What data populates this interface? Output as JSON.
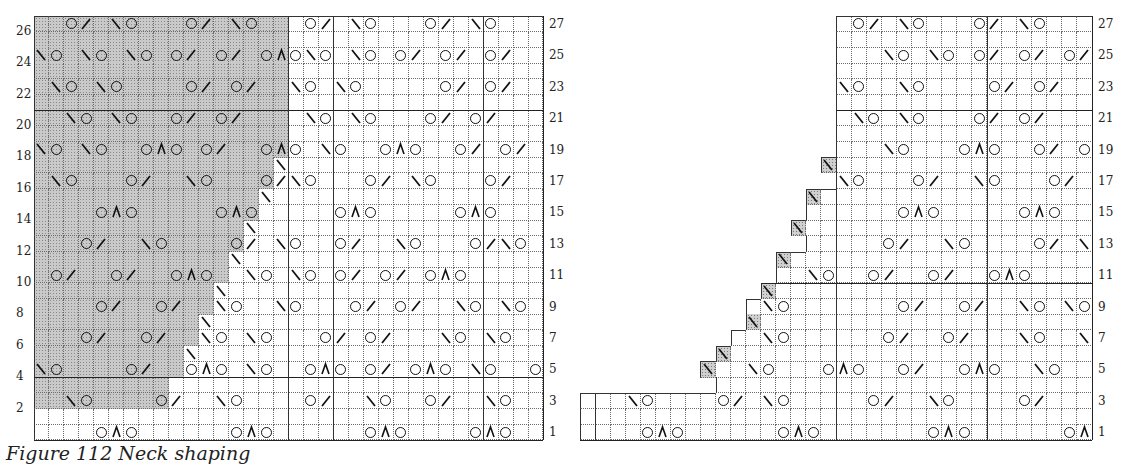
{
  "figure": {
    "caption": "Figure 112  Neck shaping",
    "symbols": {
      "O": "yarn-over",
      "/": "k2tog",
      "\\": "ssk",
      "A": "sk2p-double-decrease",
      ".": "knit",
      "-": "no-stitch",
      "s": "shaded-bound-off",
      "d": "shaded-decrease"
    },
    "colors": {
      "grid": "#6a6a6a",
      "ink": "#111111",
      "shade": "#c9c9c9"
    }
  },
  "left_chart": {
    "x": 34,
    "y": 16,
    "cols": 34,
    "rows": 27,
    "cell_w": 14.97,
    "cell_h": 15.7,
    "right_labels": [
      "27",
      "25",
      "23",
      "21",
      "19",
      "17",
      "15",
      "13",
      "11",
      "9",
      "7",
      "5",
      "3",
      "1"
    ],
    "left_labels": [
      "26",
      "24",
      "22",
      "20",
      "18",
      "16",
      "14",
      "12",
      "10",
      "8",
      "6",
      "4",
      "2"
    ],
    "heavy_rows_after": [
      6,
      23
    ],
    "repeat_cols": [
      17,
      20,
      30
    ],
    "grid": [
      "..O/.\\O...O/.\\O...O/.\\O...O/.\\O...",
      "..................................",
      "\\O.\\O.\\O.O/.O/.OAO\\O.\\O.O/.O/.O/.",
      "..................................",
      ".\\O.\\O....O/.O/..\\O.\\O.....O/.O/..",
      "..................................",
      "..\\O.\\O..O/.O/....\\O.\\O...O/.O/...",
      "..................................",
      "\\O.\\O..OAO.O/..OAO.\\O..OAO..O/.O/.",
      "................\\.................",
      ".\\O...O/..\\O...O/\\O...O/.\\O...O/..",
      "...............\\..................",
      "....OAO.....OAO.....OAO.....OAO....",
      "..............\\...................",
      "...O/..\\O....O/.\\O..O/..\\O...O/\\O.",
      ".............\\....................",
      ".O/..O/..OAO..\\O.\\O.O/.O/.OAO.....",
      "............\\.....................",
      "....O/..O/..\\O..\\O...O/.O/..\\O.\\O.",
      "...........\\......................",
      "...O/..O/..\\O.\\O...O/.O/...\\O.\\O..",
      "..........\\.......................",
      "\\O....O/..OAO.\\O..OAO.O/.OAO.\\O..O/",
      "..................................",
      "..\\O....O/..\\O....O/..\\O..O/..\\O..",
      "..................................",
      "....OAO......OAO......OAO....OAO..."
    ],
    "shade_to_col": [
      17,
      17,
      17,
      17,
      17,
      17,
      17,
      17,
      17,
      16,
      16,
      15,
      15,
      14,
      14,
      13,
      13,
      12,
      12,
      11,
      11,
      10,
      10,
      0,
      0,
      0,
      0
    ]
  },
  "right_chart": {
    "x": 580,
    "y": 16,
    "cols": 34,
    "rows": 27,
    "cell_w": 15.06,
    "cell_h": 15.7,
    "right_labels": [
      "27",
      "25",
      "23",
      "21",
      "19",
      "17",
      "15",
      "13",
      "11",
      "9",
      "7",
      "5",
      "3",
      "1"
    ],
    "heavy_rows_after": [
      6,
      17
    ],
    "repeat_cols": [
      1,
      17,
      27
    ],
    "grid": [
      "-----------------.O/.\\O...O/.\\O...",
      "-----------------.................",
      "-----------------...\\O.\\O.O/.O/.O/",
      "-----------------.................",
      "-----------------\\O..\\O....O/.O/..",
      "-----------------.................",
      "-----------------.\\O.\\O...O/.O/...",
      "-----------------.................",
      "-----------------...\\O...OAO..O/.O/",
      "----------------d.................",
      "-----------------\\O...O/..\\O...O/.",
      "---------------d..................",
      "---------------......OAO.....OAO...",
      "--------------d...................",
      "---------------.....O/..\\O....O/.\\O",
      "-------------d....................",
      "-------------..\\O..O/..O/..OAO.....",
      "------------d.....................",
      "-----------.\\O.......O/..O/..\\O.\\O.",
      "-----------d......................",
      "----------..\\O......O/..O/...\\O..\\O",
      "---------d........................",
      "--------d..\\O...OAO..O/..OAO..\\O...",
      "---------.........................",
      "...\\O....O/.\\O.....O/..\\O....O/...",
      "..................................",
      "....OAO......OAO.......OAO......OAO"
    ]
  }
}
